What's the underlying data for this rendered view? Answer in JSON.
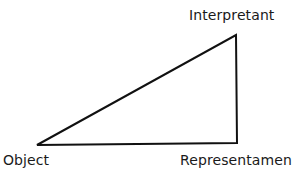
{
  "diagram": {
    "type": "semiotic-triangle",
    "nodes": {
      "interpretant": {
        "label": "Interpretant",
        "x": 236,
        "y": 35
      },
      "object": {
        "label": "Object",
        "x": 37,
        "y": 145
      },
      "representamen": {
        "label": "Representamen",
        "x": 237,
        "y": 143
      }
    },
    "edges": [
      {
        "from": "object",
        "to": "interpretant"
      },
      {
        "from": "interpretant",
        "to": "representamen"
      },
      {
        "from": "representamen",
        "to": "object"
      }
    ],
    "colors": {
      "stroke": "#111111",
      "text": "#1a1a1a",
      "background": "#ffffff"
    }
  }
}
